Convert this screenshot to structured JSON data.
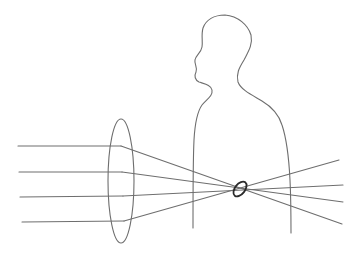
{
  "diagram": {
    "title": "",
    "colors": {
      "background": "#ffffff",
      "line": "#6e6e6e",
      "focus": "#2a2a2a"
    },
    "labels": []
  }
}
